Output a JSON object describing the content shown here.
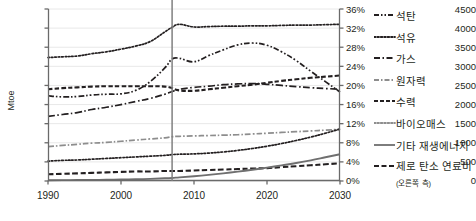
{
  "axes": {
    "y_left_label": "Mtoe",
    "y_left_ticks": [
      "4500",
      "4000",
      "3500",
      "3000",
      "2500",
      "2000",
      "1500",
      "1000",
      "500",
      "0"
    ],
    "y_right_ticks": [
      "36%",
      "32%",
      "28%",
      "24%",
      "20%",
      "16%",
      "12%",
      "8%",
      "4%",
      "0%"
    ],
    "x_ticks": [
      "1990",
      "2000",
      "2010",
      "2020",
      "2030"
    ]
  },
  "legend": {
    "items": [
      {
        "label": "석탄",
        "style": "dash-dot-dot"
      },
      {
        "label": "석유",
        "style": "dotted"
      },
      {
        "label": "가스",
        "style": "dash-dot"
      },
      {
        "label": "원자력",
        "style": "dash-dot-grey"
      },
      {
        "label": "수력",
        "style": "dash-short"
      },
      {
        "label": "바이오매스",
        "style": "dotted"
      },
      {
        "label": "기타 재생에너지",
        "style": "solid-grey"
      },
      {
        "label": "제로 탄소 연료비",
        "style": "dash-long",
        "sub": "(오른쪽 측)"
      }
    ]
  },
  "colors": {
    "ink": "#231f20",
    "grey_series": "#8d8d8d",
    "gridline": "#e8e8e8",
    "divider": "#808080"
  },
  "chart_data": {
    "type": "line",
    "title": "",
    "xlabel": "",
    "ylabel": "Mtoe",
    "ylabel_right": "",
    "xlim": [
      1990,
      2030
    ],
    "ylim": [
      0,
      4500
    ],
    "ylim_right": [
      0,
      36
    ],
    "grid": true,
    "legend_position": "right",
    "divider_year": 2007,
    "x": [
      1990,
      1992,
      1994,
      1996,
      1998,
      2000,
      2002,
      2004,
      2006,
      2007,
      2008,
      2010,
      2012,
      2014,
      2016,
      2018,
      2020,
      2022,
      2024,
      2026,
      2028,
      2030
    ],
    "series": [
      {
        "name": "석유",
        "axis": "left",
        "style": "dotted",
        "values": [
          3230,
          3250,
          3270,
          3330,
          3380,
          3450,
          3530,
          3650,
          3900,
          4020,
          4100,
          4030,
          4040,
          4050,
          4050,
          4060,
          4060,
          4070,
          4080,
          4080,
          4090,
          4100
        ]
      },
      {
        "name": "석탄",
        "axis": "left",
        "style": "dash-dot-dot",
        "values": [
          2230,
          2200,
          2210,
          2250,
          2270,
          2280,
          2370,
          2600,
          2960,
          3190,
          3210,
          3120,
          3280,
          3430,
          3560,
          3610,
          3550,
          3380,
          3150,
          2870,
          2600,
          2330
        ]
      },
      {
        "name": "수력",
        "axis": "left",
        "style": "dash-short",
        "values": [
          2400,
          2430,
          2450,
          2470,
          2480,
          2480,
          2480,
          2480,
          2470,
          2430,
          2370,
          2360,
          2400,
          2440,
          2480,
          2520,
          2570,
          2620,
          2660,
          2700,
          2730,
          2760
        ]
      },
      {
        "name": "가스",
        "axis": "left",
        "style": "dash-dot",
        "values": [
          1690,
          1740,
          1790,
          1870,
          1930,
          2000,
          2080,
          2160,
          2270,
          2340,
          2400,
          2450,
          2480,
          2520,
          2540,
          2550,
          2530,
          2500,
          2470,
          2440,
          2420,
          2400
        ]
      },
      {
        "name": "원자력",
        "axis": "left",
        "style": "dash-dot-grey",
        "values": [
          900,
          930,
          960,
          990,
          1010,
          1040,
          1070,
          1100,
          1130,
          1160,
          1170,
          1180,
          1190,
          1200,
          1210,
          1230,
          1250,
          1270,
          1290,
          1310,
          1330,
          1350
        ]
      },
      {
        "name": "바이오매스",
        "axis": "left",
        "style": "dotted",
        "values": [
          520,
          540,
          550,
          570,
          590,
          610,
          630,
          650,
          670,
          690,
          700,
          710,
          730,
          760,
          800,
          850,
          910,
          980,
          1060,
          1150,
          1250,
          1360
        ]
      },
      {
        "name": "제로 탄소 연료비",
        "axis": "right",
        "style": "dash-long",
        "values": [
          1.4,
          1.5,
          1.6,
          1.7,
          1.8,
          1.9,
          2.0,
          2.0,
          2.1,
          2.1,
          2.1,
          2.2,
          2.3,
          2.4,
          2.5,
          2.6,
          2.7,
          2.9,
          3.1,
          3.3,
          3.5,
          3.7
        ]
      },
      {
        "name": "기타 재생에너지",
        "axis": "left",
        "style": "solid-grey",
        "values": [
          20,
          22,
          25,
          28,
          32,
          38,
          45,
          55,
          70,
          80,
          95,
          125,
          160,
          200,
          245,
          295,
          350,
          410,
          470,
          540,
          620,
          700
        ]
      }
    ]
  }
}
